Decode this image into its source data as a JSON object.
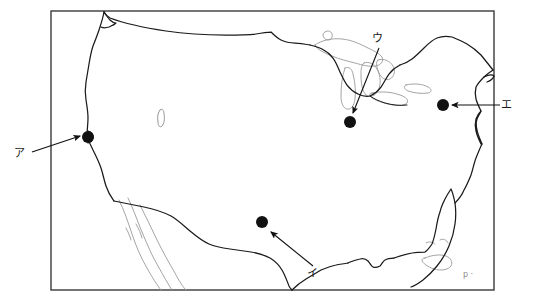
{
  "figure": {
    "type": "outline-map",
    "region": "Contiguous United States",
    "background_color": "#ffffff",
    "ink_color": "#1a1a1a",
    "secondary_ink_color": "#8f8f8f",
    "frame": {
      "name": "map-border",
      "x": 51,
      "y": 11,
      "width": 443,
      "height": 279,
      "stroke_color": "#3a3a3a"
    }
  },
  "markers": [
    {
      "id": "marker-a",
      "label": "ア",
      "label_x": 19,
      "label_y": 157,
      "dot_x": 88,
      "dot_y": 137,
      "dot_radius": 6,
      "arrow_from_x": 32,
      "arrow_from_y": 152,
      "arrow_to_x": 80,
      "arrow_to_y": 136
    },
    {
      "id": "marker-i",
      "label": "イ",
      "label_x": 312,
      "label_y": 277,
      "dot_x": 262,
      "dot_y": 222,
      "dot_radius": 6,
      "arrow_from_x": 313,
      "arrow_from_y": 266,
      "arrow_to_x": 271,
      "arrow_to_y": 232
    },
    {
      "id": "marker-u",
      "label": "ウ",
      "label_x": 377,
      "label_y": 42,
      "dot_x": 350,
      "dot_y": 122,
      "dot_radius": 6,
      "arrow_from_x": 379,
      "arrow_from_y": 48,
      "arrow_to_x": 353,
      "arrow_to_y": 113
    },
    {
      "id": "marker-e",
      "label": "エ",
      "label_x": 506,
      "label_y": 108,
      "dot_x": 443,
      "dot_y": 105,
      "dot_radius": 6,
      "arrow_from_x": 500,
      "arrow_from_y": 105,
      "arrow_to_x": 452,
      "arrow_to_y": 105
    }
  ],
  "corner_mark": {
    "text": "p ·",
    "x": 463,
    "y": 277
  }
}
